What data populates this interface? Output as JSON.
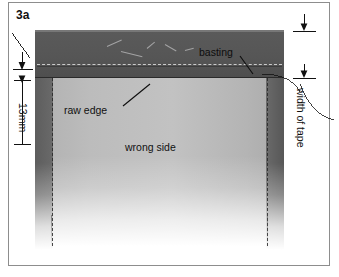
{
  "figure": {
    "label": "3a",
    "caption_labels": {
      "basting": "basting",
      "raw_edge": "raw edge",
      "wrong_side": "wrong side"
    },
    "dimensions": [
      {
        "id": "seam-allowance",
        "value": "13mm",
        "orientation": "vertical-left"
      },
      {
        "id": "tape-width",
        "value": "width of tape",
        "orientation": "vertical-right"
      }
    ],
    "colors": {
      "tape": "#565656",
      "fabric": "#bcbcbc",
      "allowance": "#646464",
      "frame": "#8d8d8d",
      "ink": "#111111",
      "page": "#ffffff"
    }
  }
}
